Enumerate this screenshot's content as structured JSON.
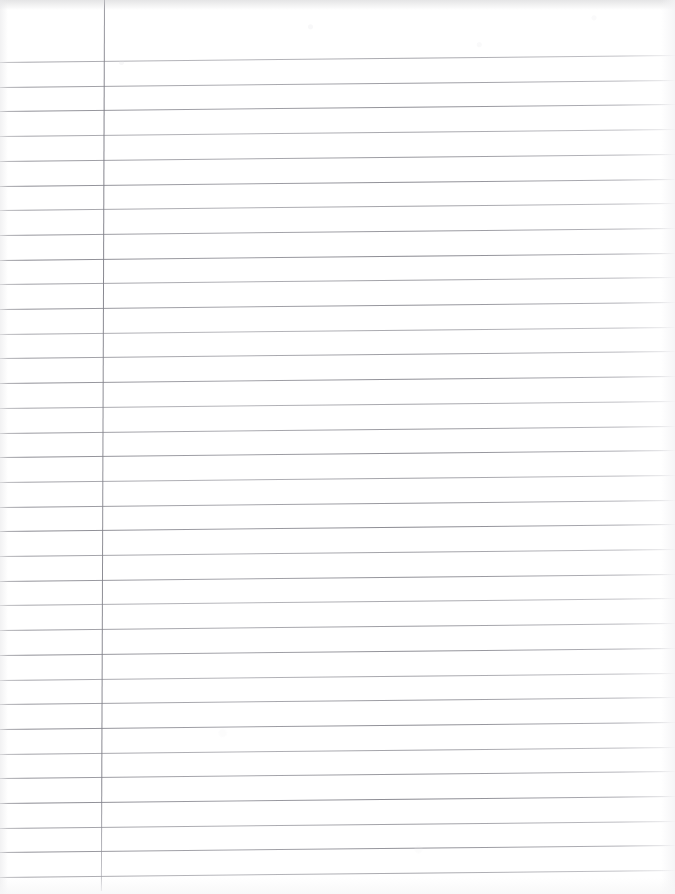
{
  "document": {
    "kind": "scanned-lined-paper",
    "title": "Blank lined notebook page",
    "text_content": "",
    "background_color": "#ffffff",
    "width_px": 675,
    "height_px": 894
  },
  "paper": {
    "ruling_style": "wide-ruled",
    "rule_color": "#84848c",
    "margin_rule_color": "#7c7c85",
    "rule_count": 34,
    "first_rule_y_px": 62,
    "rule_spacing_px": 24.7,
    "rule_left_x_px": 0,
    "rule_right_x_px": 675,
    "skew_deg": -0.6,
    "margin_rule_x_px": 104,
    "margin_rule_top_y_px": 0,
    "margin_rule_bottom_y_px": 891,
    "margin_rule_skew_deg": 0.2
  },
  "scan": {
    "edge_tone_top": "#ceced0",
    "edge_tone_left": "#e8e8ea",
    "edge_tone_right": "#f3f3f5",
    "edge_tone_bottom": "#f6f6f7"
  },
  "annotations": {
    "handwriting": [],
    "stamps": [],
    "page_number": ""
  }
}
